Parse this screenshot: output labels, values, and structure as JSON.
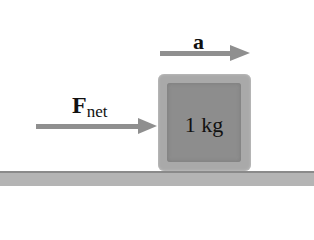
{
  "diagram": {
    "acceleration_label": "a",
    "force_label": "F",
    "force_subscript": "net",
    "block_label": "1 kg"
  },
  "colors": {
    "arrow": "#8f8f8f",
    "block_outer": "#a9a9a9",
    "block_inner": "#8d8d8d",
    "floor": "#b4b4b4"
  }
}
